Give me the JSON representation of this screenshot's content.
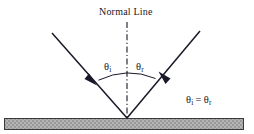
{
  "figure": {
    "title_label": "Normal Line",
    "background_color": "#ffffff",
    "ink_color": "#181828",
    "caption_note": "Law of reflection diagram"
  },
  "labels": {
    "normal_line": "Normal Line",
    "theta_symbol": "θ",
    "incident_subscript": "i",
    "reflected_subscript": "r",
    "equals_operator": "="
  },
  "angles": {
    "incident": {
      "name": "angle-of-incidence",
      "symbol": "θ",
      "subscript": "i",
      "degrees_from_normal": 37
    },
    "reflected": {
      "name": "angle-of-reflection",
      "symbol": "θ",
      "subscript": "r",
      "degrees_from_normal": 37
    }
  },
  "relation": {
    "left": "θ",
    "left_sub": "i",
    "operator": "=",
    "right": "θ",
    "right_sub": "r"
  },
  "surface": {
    "name": "reflecting-surface",
    "fill_color": "#a8a8a8",
    "border_color": "#3a3a3a",
    "pattern": "cross-hatch",
    "x": 4,
    "y": 118,
    "width": 240,
    "height": 12
  },
  "geometry": {
    "vertex": {
      "x": 127,
      "y": 118
    },
    "normal_line": {
      "x": 127,
      "y_top": 22,
      "y_bottom": 118,
      "style": "dash-dot"
    },
    "incident_ray": {
      "start": {
        "x": 52,
        "y": 33
      },
      "end": {
        "x": 127,
        "y": 118
      },
      "arrow_at": {
        "x": 93,
        "y": 80
      },
      "direction": "down-right"
    },
    "reflected_ray": {
      "start": {
        "x": 127,
        "y": 118
      },
      "end": {
        "x": 200,
        "y": 31
      },
      "arrow_at": {
        "x": 162,
        "y": 76
      },
      "direction": "up-right"
    },
    "arc": {
      "center": {
        "x": 127,
        "y": 118
      },
      "radius": 48,
      "spans": "between incident and reflected rays"
    }
  }
}
